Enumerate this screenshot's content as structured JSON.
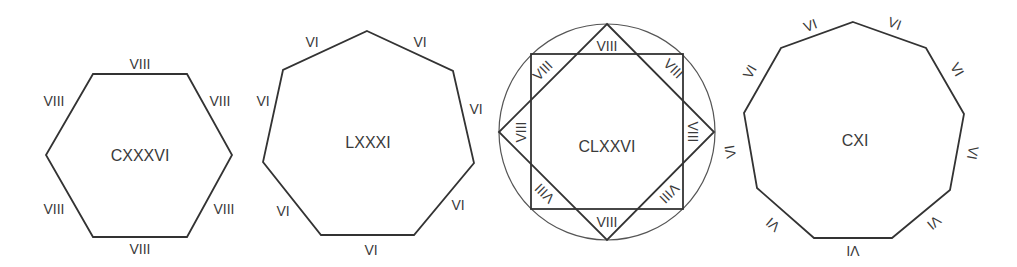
{
  "figure": {
    "shapes": [
      {
        "id": "hexagon",
        "sides": 6,
        "center_label": "CXXXVI",
        "side_label": "VIII",
        "side_labels": [
          "VIII",
          "VIII",
          "VIII",
          "VIII",
          "VIII",
          "VIII"
        ]
      },
      {
        "id": "heptagon",
        "sides": 7,
        "center_label": "LXXXI",
        "side_label": "VI",
        "side_labels": [
          "VI",
          "VI",
          "VI",
          "VI",
          "VI",
          "VI",
          "VI"
        ]
      },
      {
        "id": "octagram-in-circle",
        "sides": 8,
        "center_label": "CLXXVI",
        "side_label": "VIII",
        "side_labels": [
          "VIII",
          "VIII",
          "VIII",
          "VIII",
          "VIII",
          "VIII",
          "VIII",
          "VIII"
        ]
      },
      {
        "id": "nonagon",
        "sides": 9,
        "center_label": "CXI",
        "side_label": "VI",
        "side_labels": [
          "VI",
          "VI",
          "VI",
          "VI",
          "VI",
          "VI",
          "VI",
          "VI",
          "VI"
        ]
      }
    ],
    "colors": {
      "stroke": "#333333",
      "circle": "#555555",
      "text": "#3a3a3a",
      "background": "#ffffff"
    }
  }
}
